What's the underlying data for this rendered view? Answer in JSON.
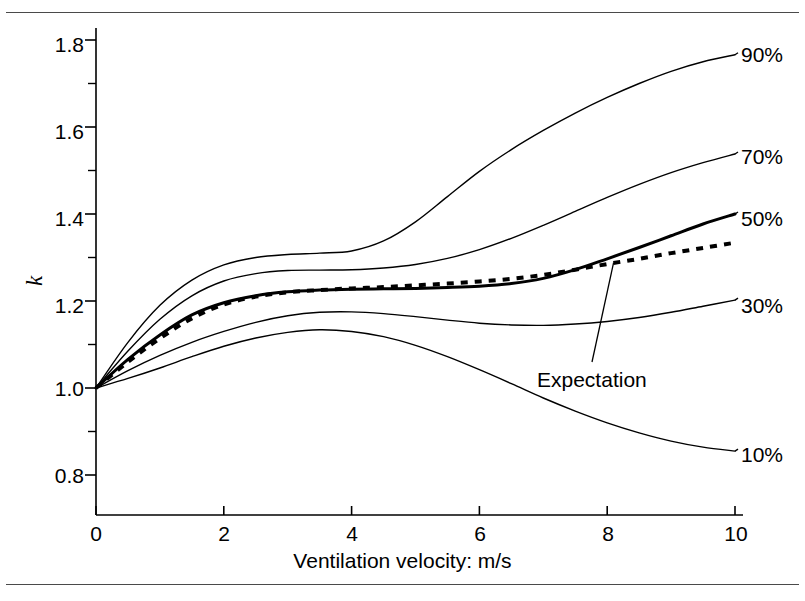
{
  "figure": {
    "y_axis_title": "k",
    "x_axis_title": "Ventilation velocity: m/s",
    "annotation_label": "Expectation",
    "line_color": "#000000"
  },
  "chart_data": {
    "type": "line",
    "title": "",
    "xlabel": "Ventilation velocity: m/s",
    "ylabel": "k",
    "xlim": [
      0,
      10
    ],
    "ylim": [
      0.72,
      1.85
    ],
    "grid": false,
    "legend_position": "right-inline-labels",
    "xticks": [
      0,
      2,
      4,
      6,
      8,
      10
    ],
    "xtick_labels": [
      "0",
      "2",
      "4",
      "6",
      "8",
      "10"
    ],
    "yticks": [
      0.8,
      1.0,
      1.2,
      1.4,
      1.6,
      1.8
    ],
    "ytick_labels": [
      "0.8",
      "1.0",
      "1.2",
      "1.4",
      "1.6",
      "1.8"
    ],
    "y_minor_ticks": [
      0.9,
      1.1,
      1.3,
      1.5,
      1.7
    ],
    "x": [
      0,
      0.5,
      1,
      1.5,
      2,
      2.5,
      3,
      3.5,
      4,
      4.5,
      5,
      5.5,
      6,
      6.5,
      7,
      7.5,
      8,
      8.5,
      9,
      9.5,
      10
    ],
    "series": [
      {
        "name": "90%",
        "label": "90%",
        "style": "solid",
        "width": 1.4,
        "values": [
          1.0,
          1.105,
          1.19,
          1.248,
          1.283,
          1.3,
          1.307,
          1.31,
          1.315,
          1.338,
          1.382,
          1.44,
          1.498,
          1.548,
          1.592,
          1.632,
          1.668,
          1.7,
          1.728,
          1.75,
          1.766
        ]
      },
      {
        "name": "70%",
        "label": "70%",
        "style": "solid",
        "width": 1.4,
        "values": [
          1.0,
          1.085,
          1.158,
          1.212,
          1.246,
          1.263,
          1.27,
          1.271,
          1.272,
          1.276,
          1.284,
          1.298,
          1.318,
          1.344,
          1.374,
          1.406,
          1.438,
          1.468,
          1.495,
          1.518,
          1.538
        ]
      },
      {
        "name": "50%",
        "label": "50%",
        "style": "solid-bold",
        "width": 3.0,
        "values": [
          1.0,
          1.066,
          1.122,
          1.168,
          1.196,
          1.212,
          1.221,
          1.225,
          1.227,
          1.228,
          1.229,
          1.231,
          1.234,
          1.24,
          1.252,
          1.272,
          1.297,
          1.323,
          1.35,
          1.377,
          1.4
        ]
      },
      {
        "name": "Expectation",
        "label": "Expectation",
        "style": "dotted",
        "width": 4.0,
        "values": [
          1.0,
          1.06,
          1.114,
          1.16,
          1.192,
          1.21,
          1.22,
          1.225,
          1.229,
          1.232,
          1.236,
          1.24,
          1.245,
          1.251,
          1.26,
          1.272,
          1.285,
          1.297,
          1.31,
          1.322,
          1.334
        ]
      },
      {
        "name": "30%",
        "label": "30%",
        "style": "solid",
        "width": 1.4,
        "values": [
          1.0,
          1.04,
          1.075,
          1.105,
          1.13,
          1.151,
          1.166,
          1.174,
          1.175,
          1.171,
          1.164,
          1.156,
          1.149,
          1.145,
          1.144,
          1.147,
          1.153,
          1.162,
          1.174,
          1.188,
          1.202
        ]
      },
      {
        "name": "10%",
        "label": "10%",
        "style": "solid",
        "width": 1.4,
        "values": [
          1.0,
          1.022,
          1.046,
          1.072,
          1.096,
          1.115,
          1.128,
          1.134,
          1.13,
          1.118,
          1.098,
          1.072,
          1.042,
          1.01,
          0.977,
          0.947,
          0.92,
          0.897,
          0.878,
          0.864,
          0.855
        ]
      }
    ],
    "series_label_anchors": [
      {
        "label": "90%",
        "x": 10.0,
        "y": 1.766
      },
      {
        "label": "70%",
        "x": 10.0,
        "y": 1.538
      },
      {
        "label": "50%",
        "x": 10.0,
        "y": 1.4
      },
      {
        "label": "30%",
        "x": 10.0,
        "y": 1.202
      },
      {
        "label": "10%",
        "x": 10.0,
        "y": 0.855
      }
    ],
    "annotations": [
      {
        "text": "Expectation",
        "points_to_x": 8.1,
        "points_to_y": 1.288
      }
    ]
  },
  "labels": {
    "ytick_0": "1.8",
    "ytick_1": "1.6",
    "ytick_2": "1.4",
    "ytick_3": "1.2",
    "ytick_4": "1.0",
    "ytick_5": "0.8",
    "xtick_0": "0",
    "xtick_1": "2",
    "xtick_2": "4",
    "xtick_3": "6",
    "xtick_4": "8",
    "xtick_5": "10",
    "series_90": "90%",
    "series_70": "70%",
    "series_50": "50%",
    "series_30": "30%",
    "series_10": "10%"
  }
}
